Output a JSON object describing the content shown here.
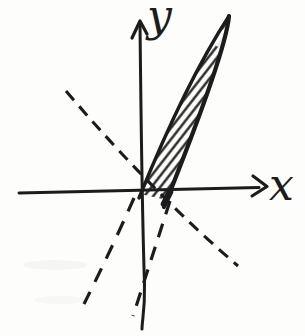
{
  "figure": {
    "type": "hand-drawn coordinate-plane sketch",
    "axes": {
      "x_label": "x",
      "y_label": "y"
    },
    "elements": [
      {
        "name": "x-axis",
        "style": "solid line with right arrowhead"
      },
      {
        "name": "y-axis",
        "style": "solid line with up arrowhead"
      },
      {
        "name": "hatched-wedge",
        "style": "narrow triangular region in first quadrant filled with diagonal hatching"
      },
      {
        "name": "wedge-left-edge",
        "style": "solid steep line through the origin"
      },
      {
        "name": "wedge-right-edge",
        "style": "solid steeper line meeting the x-axis right of the origin"
      },
      {
        "name": "dashed-extension-left-edge",
        "style": "dashed continuation into third quadrant"
      },
      {
        "name": "dashed-extension-right-edge",
        "style": "dashed continuation into third quadrant"
      },
      {
        "name": "dashed-negative-slope-line",
        "style": "dashed line from upper left to lower right through the origin region"
      }
    ]
  },
  "colors": {
    "ink": "#1c1c1c",
    "paper": "#fdfdfb"
  }
}
